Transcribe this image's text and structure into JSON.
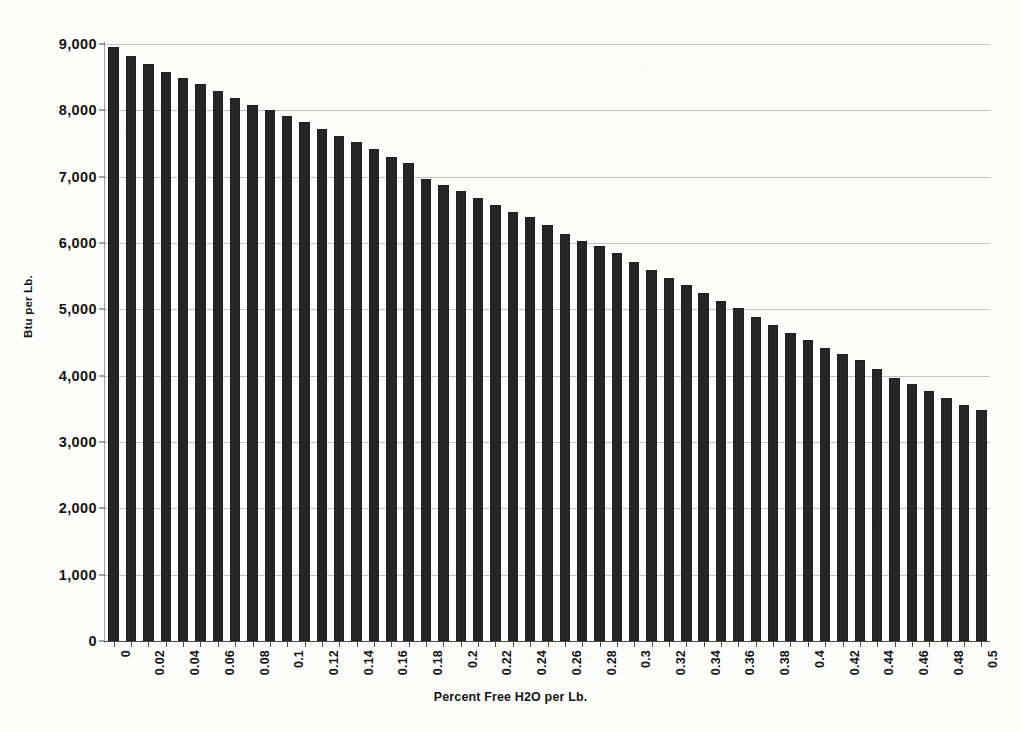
{
  "chart_data": {
    "type": "bar",
    "title": "",
    "xlabel": "Percent Free H2O per Lb.",
    "ylabel": "Btu per Lb.",
    "ylim": [
      0,
      9000
    ],
    "xlim": [
      0,
      0.5
    ],
    "grid": true,
    "legend": false,
    "y_ticks": [
      "0",
      "1,000",
      "2,000",
      "3,000",
      "4,000",
      "5,000",
      "6,000",
      "7,000",
      "8,000",
      "9,000"
    ],
    "y_tick_values": [
      0,
      1000,
      2000,
      3000,
      4000,
      5000,
      6000,
      7000,
      8000,
      9000
    ],
    "x_tick_labels": [
      "0",
      "0.02",
      "0.04",
      "0.06",
      "0.08",
      "0.1",
      "0.12",
      "0.14",
      "0.16",
      "0.18",
      "0.2",
      "0.22",
      "0.24",
      "0.26",
      "0.28",
      "0.3",
      "0.32",
      "0.34",
      "0.36",
      "0.38",
      "0.4",
      "0.42",
      "0.44",
      "0.46",
      "0.48",
      "0.5"
    ],
    "x_tick_step": 0.02,
    "categories": [
      "0",
      "0.01",
      "0.02",
      "0.03",
      "0.04",
      "0.05",
      "0.06",
      "0.07",
      "0.08",
      "0.09",
      "0.1",
      "0.11",
      "0.12",
      "0.13",
      "0.14",
      "0.15",
      "0.16",
      "0.17",
      "0.18",
      "0.19",
      "0.2",
      "0.21",
      "0.22",
      "0.23",
      "0.24",
      "0.25",
      "0.26",
      "0.27",
      "0.28",
      "0.29",
      "0.3",
      "0.31",
      "0.32",
      "0.33",
      "0.34",
      "0.35",
      "0.36",
      "0.37",
      "0.38",
      "0.39",
      "0.4",
      "0.41",
      "0.42",
      "0.43",
      "0.44",
      "0.45",
      "0.46",
      "0.47",
      "0.48",
      "0.49",
      "0.5"
    ],
    "values": [
      8960,
      8820,
      8700,
      8580,
      8490,
      8400,
      8290,
      8180,
      8080,
      8010,
      7920,
      7820,
      7720,
      7620,
      7530,
      7420,
      7290,
      7200,
      6970,
      6880,
      6780,
      6680,
      6570,
      6470,
      6390,
      6270,
      6140,
      6030,
      5960,
      5850,
      5720,
      5600,
      5480,
      5360,
      5240,
      5120,
      5020,
      4880,
      4770,
      4650,
      4540,
      4420,
      4320,
      4230,
      4100,
      3970,
      3870,
      3770,
      3670,
      3560,
      3490
    ],
    "bar_color": "#262626",
    "background_color": "#fdfdfc",
    "gridline_color": "#b9b9b9",
    "axis_color": "#4a4a4a"
  }
}
